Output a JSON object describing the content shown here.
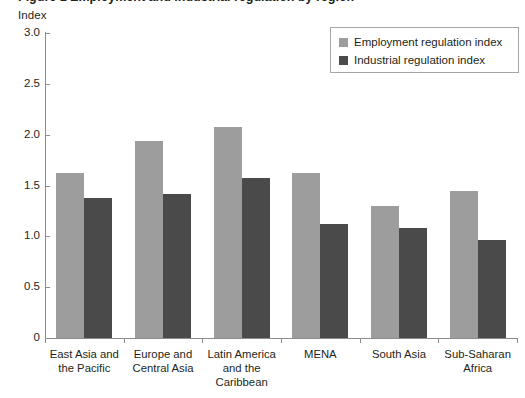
{
  "title": {
    "cropped_text": "Figure 1 Employment and industrial regulation by region"
  },
  "axis": {
    "y_title": "Index",
    "y_ticks": [
      "3.0",
      "2.5",
      "2.0",
      "1.5",
      "1.0",
      "0.5",
      "0"
    ]
  },
  "legend": {
    "items": [
      {
        "label": "Employment regulation index",
        "color": "#9d9d9d",
        "swatch_name": "legend-swatch-employment"
      },
      {
        "label": "Industrial regulation index",
        "color": "#4a4a4a",
        "swatch_name": "legend-swatch-industrial"
      }
    ]
  },
  "categories_display": [
    [
      "East Asia and",
      "the Pacific"
    ],
    [
      "Europe and",
      "Central Asia"
    ],
    [
      "Latin America",
      "and the",
      "Caribbean"
    ],
    [
      "MENA"
    ],
    [
      "South Asia"
    ],
    [
      "Sub-Saharan",
      "Africa"
    ]
  ],
  "chart_data": {
    "type": "bar",
    "title": "Employment and industrial regulation by region",
    "xlabel": "",
    "ylabel": "Index",
    "ylim": [
      0,
      3.0
    ],
    "yticks": [
      0,
      0.5,
      1.0,
      1.5,
      2.0,
      2.5,
      3.0
    ],
    "grid": false,
    "legend_position": "top-right",
    "categories": [
      "East Asia and the Pacific",
      "Europe and Central Asia",
      "Latin America and the Caribbean",
      "MENA",
      "South Asia",
      "Sub-Saharan Africa"
    ],
    "series": [
      {
        "name": "Employment regulation index",
        "color": "#9d9d9d",
        "values": [
          1.62,
          1.94,
          2.08,
          1.62,
          1.3,
          1.45
        ]
      },
      {
        "name": "Industrial regulation index",
        "color": "#4a4a4a",
        "values": [
          1.38,
          1.42,
          1.57,
          1.12,
          1.08,
          0.96
        ]
      }
    ]
  }
}
